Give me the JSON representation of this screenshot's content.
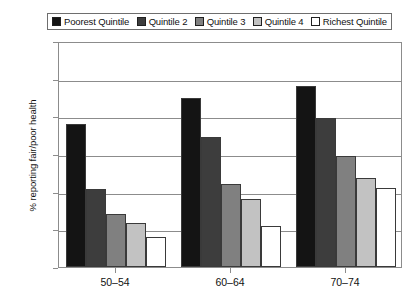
{
  "chart_data": {
    "type": "bar",
    "title": "",
    "subtitle": "",
    "xlabel": "",
    "ylabel": "% reporting fair/poor health",
    "categories": [
      "50–54",
      "60–64",
      "70–74"
    ],
    "ylim": [
      0,
      60
    ],
    "yticks": [
      0,
      10,
      20,
      30,
      40,
      50,
      60
    ],
    "ytick_labels": [
      "0",
      "10",
      "20",
      "30",
      "40",
      "50",
      "60"
    ],
    "grid": "horizontal",
    "legend_position": "top",
    "series": [
      {
        "name": "Poorest Quintile",
        "color": "#141414",
        "values": [
          38,
          45,
          48
        ]
      },
      {
        "name": "Quintile 2",
        "color": "#3d3d3d",
        "values": [
          20.7,
          34.5,
          39.5
        ]
      },
      {
        "name": "Quintile 3",
        "color": "#808080",
        "values": [
          14,
          22,
          29.5
        ]
      },
      {
        "name": "Quintile 4",
        "color": "#c2c2c2",
        "values": [
          11.7,
          18,
          23.5
        ]
      },
      {
        "name": "Richest Quintile",
        "color": "#ffffff",
        "values": [
          8,
          11,
          21
        ]
      }
    ]
  },
  "legend": {
    "entries": [
      {
        "label": "Poorest Quintile",
        "swatch": "#141414"
      },
      {
        "label": "Quintile 2",
        "swatch": "#3d3d3d"
      },
      {
        "label": "Quintile 3",
        "swatch": "#808080"
      },
      {
        "label": "Quintile 4",
        "swatch": "#c2c2c2"
      },
      {
        "label": "Richest Quintile",
        "swatch": "#ffffff"
      }
    ]
  },
  "axes": {
    "y_title": "% reporting fair/poor health",
    "y_tick_labels": [
      "60",
      "50",
      "40",
      "30",
      "20",
      "10",
      "0"
    ],
    "x_tick_labels": [
      "50–54",
      "60–64",
      "70–74"
    ]
  },
  "colors": {
    "frame": "#8c8c8c",
    "bar_outline": "#3a3a3a",
    "text": "#111111",
    "background": "#ffffff"
  }
}
